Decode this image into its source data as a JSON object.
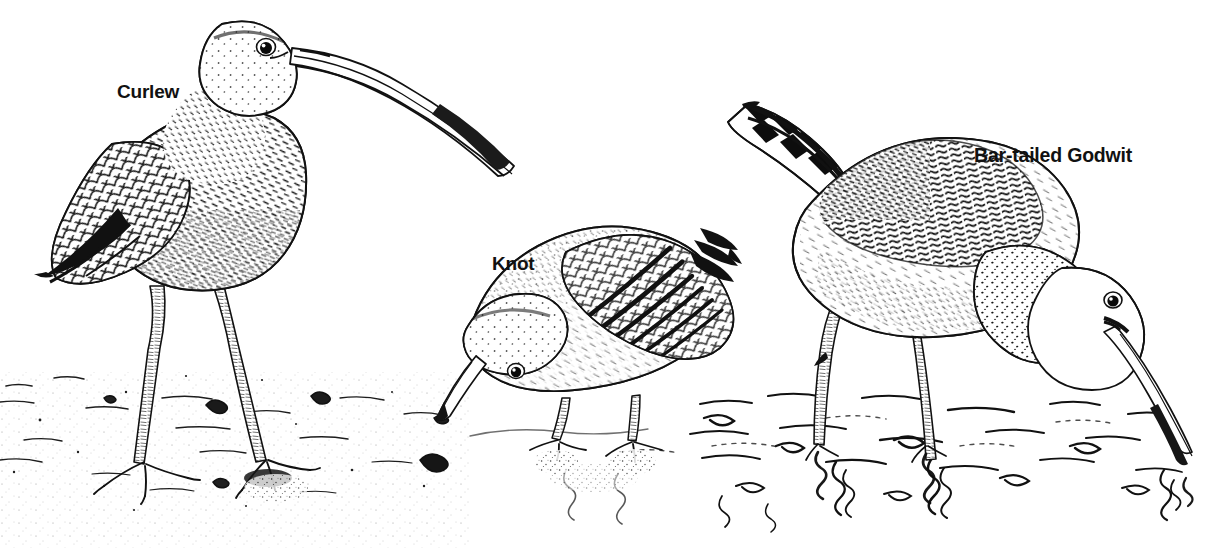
{
  "plate": {
    "title": "Shorebirds on a mudflat",
    "style": "pen-and-ink line drawing, black on white",
    "background_color": "#ffffff",
    "ink_color": "#111111",
    "width": 1205,
    "height": 548
  },
  "labels": {
    "curlew": "Curlew",
    "knot": "Knot",
    "godwit": "Bar-tailed Godwit"
  },
  "birds": [
    {
      "id": "curlew",
      "label": "Curlew",
      "position": "left",
      "pose": "standing upright, head raised",
      "bill": "very long, strongly downcurved",
      "habitat": "dry sand / mudflat",
      "plumage": "heavily streaked and speckled body, scalloped wing coverts, dark primaries"
    },
    {
      "id": "knot",
      "label": "Knot",
      "position": "centre",
      "pose": "crouched, head lowered, feeding",
      "bill": "short and straight",
      "habitat": "damp sand at waters edge",
      "plumage": "mottled upperparts, dark pointed wing tips, pale underparts"
    },
    {
      "id": "godwit",
      "label": "Bar-tailed Godwit",
      "position": "right",
      "pose": "wading, head down, bill probing the water",
      "bill": "very long, straight, slightly upturned",
      "habitat": "shallow water with ripples and reflections",
      "plumage": "boldly barred tail, mottled mantle, speckled neck and head"
    }
  ],
  "scene": {
    "ground_left": "stippled sand with small pebbles and shell fragments",
    "ground_right": "shallow water with wavy ripple lines and vertical leg reflections",
    "waterline": "runs across the lower right of the plate"
  },
  "icon_names": {
    "curlew_eye": "bird-eye-icon",
    "knot_eye": "bird-eye-icon",
    "godwit_eye": "bird-eye-icon"
  }
}
